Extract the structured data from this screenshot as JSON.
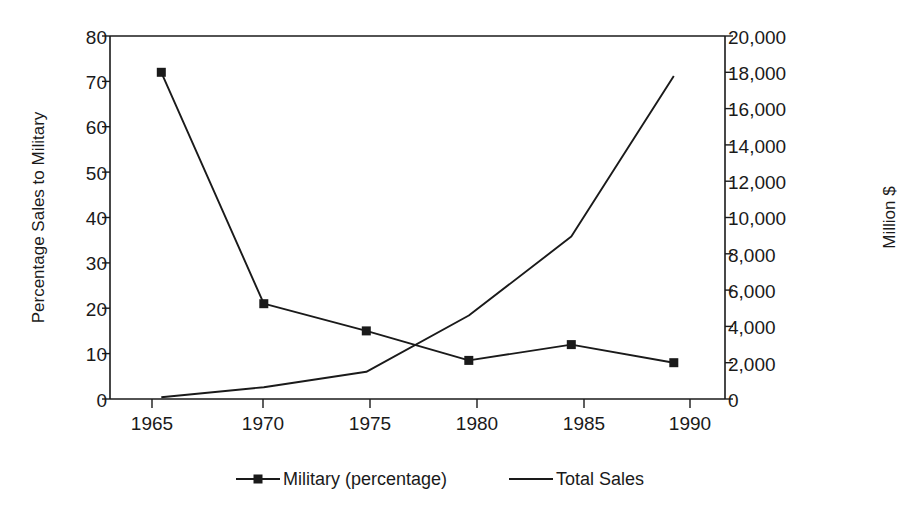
{
  "chart_data": {
    "type": "line",
    "title": "",
    "subtitle": "",
    "xlabel": "",
    "ylabel": "Percentage Sales to Military",
    "y2label": "Million $",
    "grid": false,
    "legend_position": "bottom",
    "x": [
      1965,
      1970,
      1975,
      1980,
      1985,
      1990
    ],
    "xtick_labels": [
      "1965",
      "1970",
      "1975",
      "1980",
      "1985",
      "1990"
    ],
    "xlim": [
      1962.5,
      1992.5
    ],
    "ylim": [
      0,
      80
    ],
    "ytick_labels": [
      "0",
      "10",
      "20",
      "30",
      "40",
      "50",
      "60",
      "70",
      "80"
    ],
    "ytick_values": [
      0,
      10,
      20,
      30,
      40,
      50,
      60,
      70,
      80
    ],
    "y2lim": [
      0,
      20000
    ],
    "y2tick_labels": [
      "0",
      "2,000",
      "4,000",
      "6,000",
      "8,000",
      "10,000",
      "12,000",
      "14,000",
      "16,000",
      "18,000",
      "20,000"
    ],
    "y2tick_values": [
      0,
      2000,
      4000,
      6000,
      8000,
      10000,
      12000,
      14000,
      16000,
      18000,
      20000
    ],
    "series": [
      {
        "name": "Military (percentage)",
        "axis": "left",
        "marker": "square",
        "color": "#1a1a1a",
        "values": [
          72,
          21,
          15,
          8.5,
          12,
          8
        ]
      },
      {
        "name": "Total Sales",
        "axis": "right",
        "marker": "none",
        "color": "#1a1a1a",
        "values": [
          100,
          650,
          1500,
          4600,
          8950,
          17800
        ]
      }
    ]
  },
  "legend": {
    "items": [
      {
        "label": "Military (percentage)",
        "marker": "square-line-marker"
      },
      {
        "label": "Total Sales",
        "marker": "plain-line-marker"
      }
    ]
  },
  "axes": {
    "left_title": "Percentage Sales to Military",
    "right_title": "Million $"
  }
}
